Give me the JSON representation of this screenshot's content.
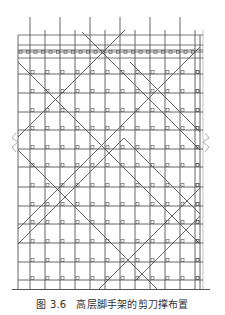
{
  "figure": {
    "caption_number": "图 3.6",
    "caption_title": "高层脚手架的剪刀撑布置",
    "colors": {
      "line": "#555555",
      "light": "#9a9a9a",
      "background": "#ffffff",
      "text": "#333333"
    },
    "frame": {
      "left_x": 18,
      "right_x": 200,
      "ground_y": 290,
      "uprights_x": [
        18,
        30,
        45,
        60,
        75,
        90,
        105,
        120,
        135,
        150,
        165,
        180,
        195,
        200
      ],
      "tall_uprights_x": [
        30,
        60,
        90,
        120,
        150,
        180
      ],
      "tall_top_y": 17,
      "short_top_y": 30,
      "top_rails_y": [
        35,
        45,
        50,
        52,
        58
      ],
      "ledgers_y": [
        74,
        93,
        112,
        130,
        149,
        167,
        187,
        206,
        224,
        243,
        262,
        280
      ],
      "toe_board_y": 54
    },
    "bracing": [
      {
        "x1": 82,
        "y1": 32,
        "x2": 200,
        "y2": 150
      },
      {
        "x1": 125,
        "y1": 30,
        "x2": 18,
        "y2": 137
      },
      {
        "x1": 18,
        "y1": 62,
        "x2": 200,
        "y2": 244
      },
      {
        "x1": 200,
        "y1": 47,
        "x2": 18,
        "y2": 229
      },
      {
        "x1": 18,
        "y1": 150,
        "x2": 120,
        "y2": 252
      },
      {
        "x1": 120,
        "y1": 252,
        "x2": 158,
        "y2": 290
      },
      {
        "x1": 200,
        "y1": 188,
        "x2": 98,
        "y2": 290
      },
      {
        "x1": 18,
        "y1": 244,
        "x2": 124,
        "y2": 138
      },
      {
        "x1": 124,
        "y1": 138,
        "x2": 200,
        "y2": 214
      },
      {
        "x1": 130,
        "y1": 62,
        "x2": 200,
        "y2": 132
      },
      {
        "x1": 200,
        "y1": 216,
        "x2": 135,
        "y2": 281
      }
    ],
    "break_marks": [
      {
        "side": "left",
        "x": 18,
        "y": 143
      },
      {
        "side": "right",
        "x": 200,
        "y": 143
      }
    ],
    "clamp_glyph": "ɒ"
  }
}
